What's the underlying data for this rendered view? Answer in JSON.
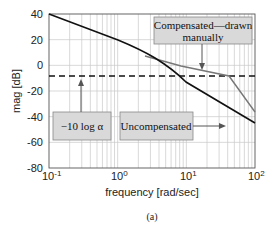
{
  "chart_data": {
    "type": "line",
    "title": "",
    "xlabel": "frequency [rad/sec]",
    "ylabel": "mag [dB]",
    "xscale": "log",
    "xlim": [
      0.1,
      100
    ],
    "ylim": [
      -80,
      40
    ],
    "x_ticks": [
      "10^-1",
      "10^0",
      "10^1",
      "10^2"
    ],
    "y_ticks": [
      "40",
      "20",
      "0",
      "-20",
      "-40",
      "-60",
      "-80"
    ],
    "grid": true,
    "caption": "(a)",
    "series": [
      {
        "name": "Uncompensated",
        "color": "#111111",
        "x": [
          0.1,
          0.3,
          1,
          2,
          3,
          5,
          8,
          10,
          20,
          50,
          100
        ],
        "y": [
          40,
          30.5,
          20,
          13.5,
          9,
          2,
          -7,
          -11,
          -23,
          -39,
          -51
        ]
      },
      {
        "name": "Compensated—drawn manually",
        "color": "#777777",
        "x": [
          3,
          10,
          22,
          100
        ],
        "y": [
          9,
          -1,
          -8,
          -37
        ]
      },
      {
        "name": "-10 log alpha",
        "style": "dashed",
        "color": "#111111",
        "x": [
          0.1,
          100
        ],
        "y": [
          -8.5,
          -8.5
        ]
      }
    ],
    "annotations": [
      {
        "text": "Compensated—drawn manually",
        "points_to": [
          22,
          -3
        ]
      },
      {
        "text": "−10 log α",
        "points_to": [
          0.3,
          -8.5
        ]
      },
      {
        "text": "Uncompensated",
        "points_to": [
          40,
          -36
        ]
      }
    ]
  },
  "labels": {
    "xlabel": "frequency [rad/sec]",
    "ylabel": "mag [dB]",
    "caption": "(a)",
    "ann_comp_line1": "Compensated—drawn",
    "ann_comp_line2": "manually",
    "ann_alpha": "−10 log α",
    "ann_uncomp": "Uncompensated",
    "yt": [
      "40",
      "20",
      "0",
      "-20",
      "-40",
      "-60",
      "-80"
    ]
  }
}
